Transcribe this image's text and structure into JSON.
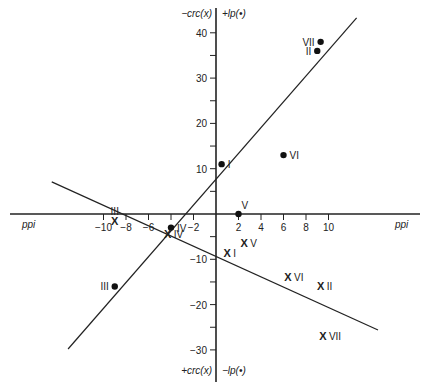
{
  "chart_data": {
    "type": "scatter",
    "title": "",
    "xlabel": "ppi",
    "ylabel_top_left": "−crc(x)",
    "ylabel_top_right": "+lp(•)",
    "ylabel_bottom_left": "+crc(x)",
    "ylabel_bottom_right": "−lp(•)",
    "xlim": [
      -19,
      19
    ],
    "ylim": [
      -35,
      44
    ],
    "grid": false,
    "x_ticks": [
      -10,
      -8,
      -6,
      -4,
      -2,
      2,
      4,
      6,
      8,
      10
    ],
    "x_tick_labels": [
      "−10",
      "−8",
      "−6",
      "",
      "−2",
      "2",
      "4",
      "6",
      "8",
      "10"
    ],
    "y_ticks": [
      40,
      35,
      30,
      25,
      20,
      15,
      10,
      5,
      -5,
      -10,
      -15,
      -20,
      -25,
      -30
    ],
    "y_tick_labels": {
      "40": "40",
      "30": "30",
      "20": "20",
      "10": "10",
      "-10": "−10",
      "-20": "−20",
      "-30": "−30"
    },
    "series": [
      {
        "name": "lp (•)",
        "marker": "dot",
        "points": [
          {
            "label": "I",
            "x": 0.5,
            "y": 11
          },
          {
            "label": "II",
            "x": 9.0,
            "y": 36
          },
          {
            "label": "III",
            "x": -9.0,
            "y": -16
          },
          {
            "label": "IV",
            "x": -4.0,
            "y": -3
          },
          {
            "label": "V",
            "x": 2.0,
            "y": 0
          },
          {
            "label": "VI",
            "x": 6.0,
            "y": 13
          },
          {
            "label": "VII",
            "x": 9.3,
            "y": 38
          }
        ]
      },
      {
        "name": "crc (x)",
        "marker": "x",
        "points": [
          {
            "label": "I",
            "x": 1.0,
            "y": -8.5
          },
          {
            "label": "II",
            "x": 9.3,
            "y": -16
          },
          {
            "label": "III",
            "x": -9.0,
            "y": -1.5
          },
          {
            "label": "IV",
            "x": -4.3,
            "y": -4.5
          },
          {
            "label": "V",
            "x": 2.5,
            "y": -6.5
          },
          {
            "label": "VI",
            "x": 6.4,
            "y": -14
          },
          {
            "label": "VII",
            "x": 9.5,
            "y": -27
          }
        ]
      }
    ],
    "regression_lines": [
      {
        "name": "lp fit (ascending)",
        "x1": -13.15,
        "y1": -29.8,
        "x2": 12.5,
        "y2": 43.3
      },
      {
        "name": "crc fit (descending)",
        "x1": -14.6,
        "y1": 7.1,
        "x2": 14.4,
        "y2": -25.6
      }
    ]
  }
}
